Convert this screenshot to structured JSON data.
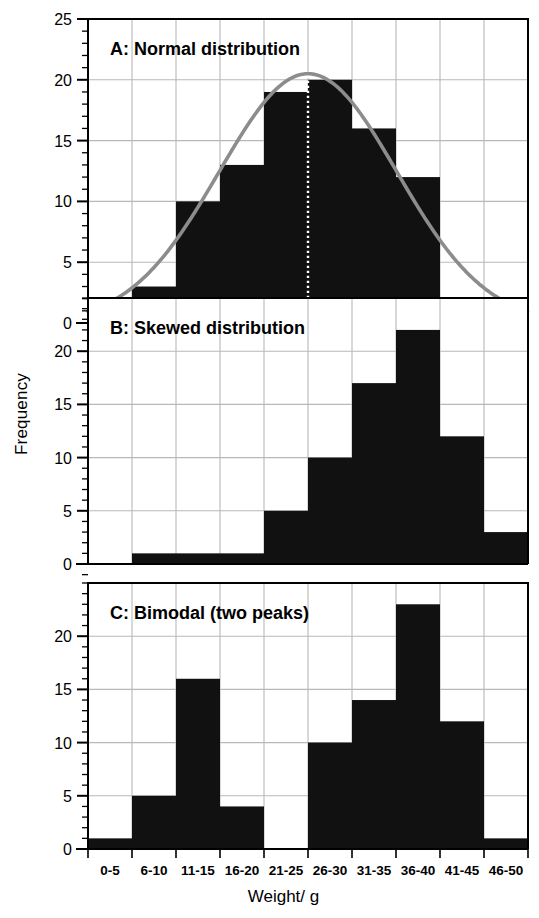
{
  "chart_data": {
    "type": "bar",
    "title": "",
    "xlabel": "Weight/ g",
    "ylabel": "Frequency",
    "categories": [
      "0-5",
      "6-10",
      "11-15",
      "16-20",
      "21-25",
      "26-30",
      "31-35",
      "36-40",
      "41-45",
      "46-50"
    ],
    "ylim": [
      0,
      25
    ],
    "yticks": [
      0,
      5,
      10,
      15,
      20,
      25
    ],
    "grid": true,
    "legend": false,
    "panels": [
      {
        "id": "A",
        "title": "A: Normal distribution",
        "values": [
          2,
          3,
          10,
          13,
          19,
          20,
          16,
          12,
          2,
          1
        ],
        "ylim": [
          0,
          25
        ],
        "yticks": [
          0,
          5,
          10,
          15,
          20,
          25
        ],
        "overlay_curve": {
          "name": "normal-curve",
          "color": "#8c8c8c",
          "peak_value": 20.5,
          "mean_bin_index": 5
        },
        "mean_marker": {
          "label": "x̄",
          "style": "dotted-vertical",
          "color": "#ffffff"
        }
      },
      {
        "id": "B",
        "title": "B: Skewed distribution",
        "values": [
          0,
          1,
          1,
          5,
          10,
          17,
          22,
          12,
          3
        ],
        "value_bins": [
          "0-5",
          "6-10",
          "11-15",
          "16-20",
          "21-25",
          "26-30",
          "31-35",
          "36-40",
          "41-45",
          "46-50"
        ],
        "values_by_bin": [
          0,
          1,
          1,
          1,
          5,
          10,
          17,
          22,
          12,
          3
        ],
        "ylim": [
          0,
          25
        ],
        "yticks": [
          0,
          5,
          10,
          15,
          20
        ]
      },
      {
        "id": "C",
        "title": "C: Bimodal (two peaks)",
        "values_by_bin": [
          1,
          5,
          16,
          4,
          0,
          10,
          14,
          23,
          12,
          1
        ],
        "ylim": [
          0,
          25
        ],
        "yticks": [
          0,
          5,
          10,
          15,
          20
        ]
      }
    ],
    "colors": {
      "bar": "#111111",
      "grid": "#b8b8b8",
      "axis": "#000000",
      "curve": "#8c8c8c",
      "mean_line": "#ffffff"
    }
  }
}
